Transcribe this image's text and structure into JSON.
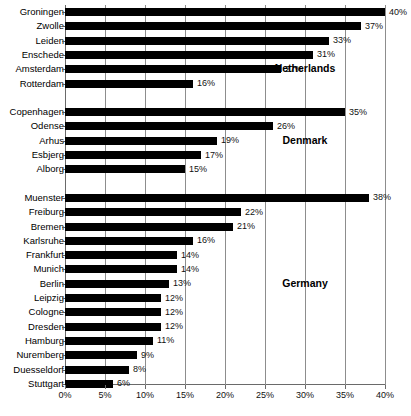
{
  "chart_data": {
    "type": "bar",
    "orientation": "horizontal",
    "title": "",
    "subtitle": "",
    "xlabel": "",
    "ylabel": "",
    "xlim": [
      0,
      40
    ],
    "xticks": [
      "0%",
      "5%",
      "10%",
      "15%",
      "20%",
      "25%",
      "30%",
      "35%",
      "40%"
    ],
    "xtick_values": [
      0,
      5,
      10,
      15,
      20,
      25,
      30,
      35,
      40
    ],
    "grid": true,
    "legend": "none",
    "value_label_suffix": "%",
    "bar_color": "#000000",
    "groups": [
      {
        "name": "Netherlands",
        "categories": [
          "Groningen",
          "Zwolle",
          "Leiden",
          "Enschede",
          "Amsterdam",
          "Rotterdam"
        ],
        "values": [
          40,
          37,
          33,
          31,
          27,
          16
        ],
        "labels": [
          "40%",
          "37%",
          "33%",
          "31%",
          "27%",
          "16%"
        ]
      },
      {
        "name": "Denmark",
        "categories": [
          "Copenhagen",
          "Odense",
          "Arhus",
          "Esbjerg",
          "Alborg"
        ],
        "values": [
          35,
          26,
          19,
          17,
          15
        ],
        "labels": [
          "35%",
          "26%",
          "19%",
          "17%",
          "15%"
        ]
      },
      {
        "name": "Germany",
        "categories": [
          "Muenster",
          "Freiburg",
          "Bremen",
          "Karlsruhe",
          "Frankfurt",
          "Munich",
          "Berlin",
          "Leipzig",
          "Cologne",
          "Dresden",
          "Hamburg",
          "Nuremberg",
          "Duesseldorf",
          "Stuttgart"
        ],
        "values": [
          38,
          22,
          21,
          16,
          14,
          14,
          13,
          12,
          12,
          12,
          11,
          9,
          8,
          6
        ],
        "labels": [
          "38%",
          "22%",
          "21%",
          "16%",
          "14%",
          "14%",
          "13%",
          "12%",
          "12%",
          "12%",
          "11%",
          "9%",
          "8%",
          "6%"
        ]
      }
    ]
  }
}
